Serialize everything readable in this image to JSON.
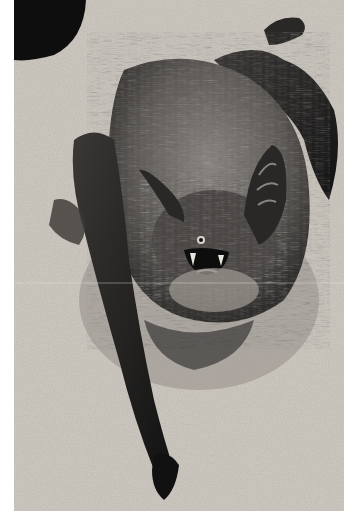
{
  "image": {
    "subject": "bat",
    "description": "Black-and-white photograph of a furry bat clinging to a rough stone/plaster surface, mouth open showing teeth, large ears, one long folded wing extending downward.",
    "style": "grayscale photograph",
    "colors": {
      "background_page": "#ffffff",
      "surface_light": "#d6d1c9",
      "surface_mid": "#a9a49c",
      "fur_mid": "#6e6a66",
      "fur_dark": "#3a3735",
      "shadow": "#141414"
    }
  }
}
